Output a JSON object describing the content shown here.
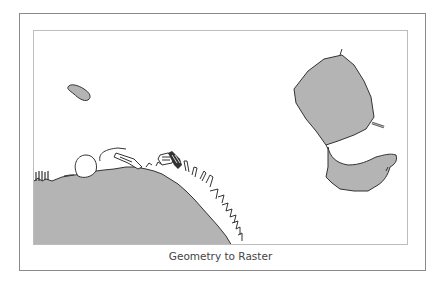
{
  "figure": {
    "caption": "Geometry to Raster"
  },
  "map": {
    "land_fill": "#b4b4b4",
    "outline_color": "#333333",
    "background": "#ffffff",
    "features": [
      "mainland-coast",
      "small-island",
      "large-island-north",
      "large-island-south"
    ]
  }
}
